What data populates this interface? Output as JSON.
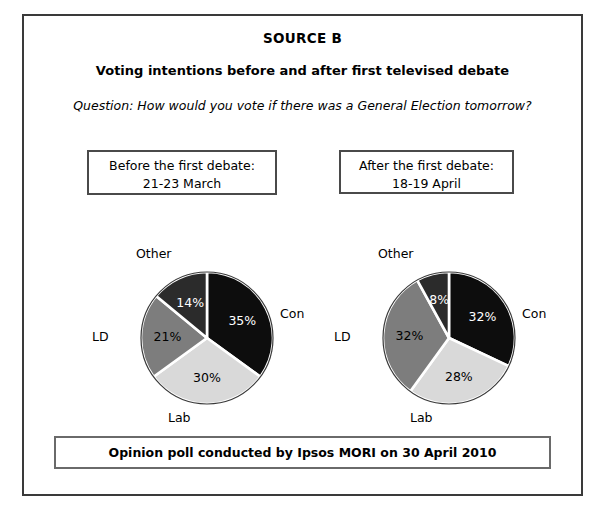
{
  "source": {
    "title": "SOURCE B",
    "subtitle": "Voting intentions before and after first televised debate",
    "question": "Question: How would you vote if there was a General Election tomorrow?",
    "footer": "Opinion poll conducted by Ipsos MORI on 30 April 2010"
  },
  "panels": [
    {
      "caption_line1": "Before the first debate:",
      "caption_line2": "21-23 March",
      "labels": {
        "other": "Other",
        "con": "Con",
        "lab": "Lab",
        "ld": "LD"
      },
      "values": {
        "con": "35%",
        "lab": "30%",
        "ld": "21%",
        "other": "14%"
      }
    },
    {
      "caption_line1": "After the first debate:",
      "caption_line2": "18-19 April",
      "labels": {
        "other": "Other",
        "con": "Con",
        "lab": "Lab",
        "ld": "LD"
      },
      "values": {
        "con": "32%",
        "lab": "28%",
        "ld": "32%",
        "other": "8%"
      }
    }
  ],
  "chart_data": [
    {
      "type": "pie",
      "title": "Before the first debate: 21-23 March",
      "categories": [
        "Con",
        "Lab",
        "LD",
        "Other"
      ],
      "values": [
        35,
        30,
        21,
        14
      ],
      "labels": [
        "35%",
        "30%",
        "21%",
        "14%"
      ],
      "colors": [
        "#0d0d0d",
        "#d9d9d9",
        "#7d7d7d",
        "#2b2b2b"
      ],
      "label_colors": [
        "#ffffff",
        "#000000",
        "#000000",
        "#ffffff"
      ],
      "start_angle_deg": 0,
      "direction": "clockwise",
      "legend": "outside-labels",
      "grid": false
    },
    {
      "type": "pie",
      "title": "After the first debate: 18-19 April",
      "categories": [
        "Con",
        "Lab",
        "LD",
        "Other"
      ],
      "values": [
        32,
        28,
        32,
        8
      ],
      "labels": [
        "32%",
        "28%",
        "32%",
        "8%"
      ],
      "colors": [
        "#0d0d0d",
        "#d9d9d9",
        "#7d7d7d",
        "#2b2b2b"
      ],
      "label_colors": [
        "#ffffff",
        "#000000",
        "#000000",
        "#ffffff"
      ],
      "start_angle_deg": 0,
      "direction": "clockwise",
      "legend": "outside-labels",
      "grid": false
    }
  ],
  "theme": {
    "outer_border": "#3a3a3a",
    "box_border": "#4a4a4a",
    "footer_border": "#6a6a6a",
    "background": "#ffffff",
    "text": "#000000"
  }
}
